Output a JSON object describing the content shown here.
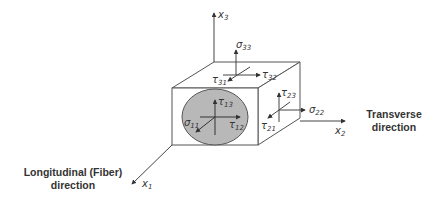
{
  "diagram": {
    "type": "stress-element-cube",
    "colors": {
      "line": "#444444",
      "fiber_fill": "#b8b8b8",
      "text": "#333333",
      "background": "#ffffff"
    },
    "axes": [
      {
        "id": "x1",
        "symbol": "x",
        "sub": "1"
      },
      {
        "id": "x2",
        "symbol": "x",
        "sub": "2"
      },
      {
        "id": "x3",
        "symbol": "x",
        "sub": "3"
      }
    ],
    "stresses": {
      "top_face": [
        {
          "symbol": "σ",
          "sub": "33"
        },
        {
          "symbol": "τ",
          "sub": "32"
        },
        {
          "symbol": "τ",
          "sub": "31"
        }
      ],
      "right_face": [
        {
          "symbol": "τ",
          "sub": "23"
        },
        {
          "symbol": "σ",
          "sub": "22"
        },
        {
          "symbol": "τ",
          "sub": "21"
        }
      ],
      "front_face": [
        {
          "symbol": "τ",
          "sub": "13"
        },
        {
          "symbol": "σ",
          "sub": "11"
        },
        {
          "symbol": "τ",
          "sub": "12"
        }
      ]
    },
    "directions": {
      "transverse": {
        "line1": "Transverse",
        "line2": "direction"
      },
      "longitudinal": {
        "line1": "Longitudinal (Fiber)",
        "line2": "direction"
      }
    }
  }
}
